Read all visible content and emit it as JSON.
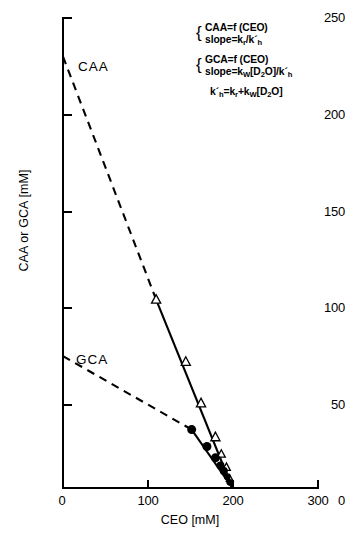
{
  "chart_data": {
    "type": "scatter",
    "title": "",
    "xlabel": "CEO  [mM]",
    "ylabel": "CAA or GCA  [mM]",
    "xlim": [
      0,
      300
    ],
    "ylim": [
      0,
      250
    ],
    "xticks": [
      0,
      100,
      200,
      300
    ],
    "yticks": [
      0,
      50,
      100,
      150,
      200,
      250
    ],
    "xtick_labels": [
      "0",
      "100",
      "200",
      "300"
    ],
    "ytick_labels": [
      "0",
      "50",
      "100",
      "150",
      "200",
      "250"
    ],
    "grid": false,
    "legend_position": "none",
    "series": [
      {
        "name": "CAA",
        "marker": "open-triangle",
        "x": [
          110,
          145,
          163,
          180,
          187,
          193,
          197
        ],
        "y": [
          100,
          67,
          45,
          27,
          18,
          11,
          5
        ],
        "fit_line": {
          "style": "solid",
          "x": [
            110,
            200
          ],
          "y": [
            100,
            0
          ]
        },
        "extrapolation": {
          "style": "dashed",
          "x": [
            0,
            110
          ],
          "y": [
            229,
            100
          ]
        },
        "y_intercept": 229
      },
      {
        "name": "GCA",
        "marker": "filled-circle",
        "x": [
          152,
          170,
          180,
          186,
          190,
          194,
          197
        ],
        "y": [
          31,
          22,
          16,
          12,
          9,
          6,
          3
        ],
        "fit_line": {
          "style": "solid",
          "x": [
            152,
            200
          ],
          "y": [
            31,
            0
          ]
        },
        "extrapolation": {
          "style": "dashed",
          "x": [
            0,
            152
          ],
          "y": [
            70,
            31
          ]
        },
        "y_intercept": 70
      }
    ],
    "series_labels": [
      {
        "text": "CAA",
        "x": 28,
        "y": 222
      },
      {
        "text": "GCA",
        "x": 26,
        "y": 70
      }
    ],
    "annotations": {
      "group1": {
        "line1": "CAA=f (CEO)",
        "line2_prefix": "slope=k",
        "line2_sub1": "r",
        "line2_mid": "/k´",
        "line2_sub2": "h"
      },
      "group2": {
        "line1": "GCA=f (CEO)",
        "line2_prefix": "slope=k",
        "line2_sub1": "W",
        "line2_mid": "[D",
        "line2_sub2": "2",
        "line2_mid2": "O]/k´",
        "line2_sub3": "h"
      },
      "equation": {
        "p1": "k´",
        "s1": "h",
        "p2": "=k",
        "s2": "r",
        "p3": "+k",
        "s3": "W",
        "p4": "[D",
        "s4": "2",
        "p5": "O]"
      }
    }
  },
  "axes": {
    "y_title": "CAA or GCA  [mM]",
    "x_title": "CEO  [mM]",
    "y_labels": [
      "250",
      "200",
      "150",
      "100",
      "50",
      "0"
    ],
    "x_labels": [
      "0",
      "100",
      "200",
      "300"
    ]
  },
  "colors": {
    "ink": "#000000",
    "background": "#ffffff"
  }
}
